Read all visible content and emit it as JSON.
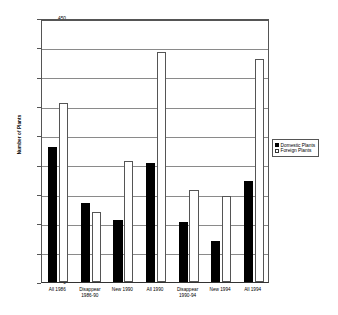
{
  "chart_data": {
    "type": "bar",
    "title": "",
    "xlabel": "",
    "ylabel": "Number of Plants",
    "ylim": [
      0,
      450
    ],
    "ytick_step": 50,
    "yticks": [
      0,
      50,
      100,
      150,
      200,
      250,
      300,
      350,
      400,
      450
    ],
    "grid": true,
    "legend_position": "right",
    "categories": [
      "All 1986",
      "Disappear\n1986-90",
      "New 1990",
      "All 1990",
      "Disappear\n1990-94",
      "New 1994",
      "All 1994"
    ],
    "category_lines": [
      [
        "All 1986"
      ],
      [
        "Disappear",
        "1986-90"
      ],
      [
        "New 1990"
      ],
      [
        "All 1990"
      ],
      [
        "Disappear",
        "1990-94"
      ],
      [
        "New 1994"
      ],
      [
        "All 1994"
      ]
    ],
    "series": [
      {
        "name": "Domestic Plants",
        "color": "#000000",
        "values": [
          230,
          134,
          106,
          203,
          102,
          70,
          172
        ]
      },
      {
        "name": "Foreign Plants",
        "color": "#ffffff",
        "values": [
          305,
          119,
          207,
          392,
          157,
          146,
          380
        ]
      }
    ]
  },
  "legend": {
    "items": [
      {
        "label": "Domestic Plants",
        "swatch": "filled-black-square"
      },
      {
        "label": "Foreign Plants",
        "swatch": "open-white-square"
      }
    ]
  },
  "axis": {
    "y_title": "Number of Plants"
  }
}
